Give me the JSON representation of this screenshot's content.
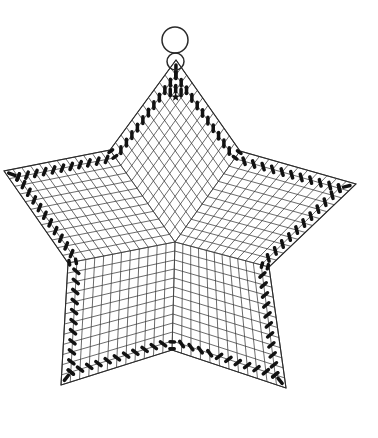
{
  "canvas": {
    "width": 378,
    "height": 438,
    "background": "#ffffff"
  },
  "style": {
    "mesh_line_color": "#3a3a3a",
    "mesh_line_width": 0.75,
    "outline_color": "#2a2a2a",
    "outline_width": 1.1,
    "bead_color": "#121212",
    "ring_color": "#2a2a2a",
    "ring_stroke_width": 1.5
  },
  "hanging_ring": {
    "large": {
      "cx": 175,
      "cy": 40,
      "r": 13
    },
    "small": {
      "cx": 175.5,
      "cy": 61.5,
      "r": 8.5
    }
  },
  "mesh": {
    "divisions": 12,
    "center": [
      175,
      242
    ],
    "kites": [
      {
        "name": "top",
        "notch_a": [
          110,
          150
        ],
        "tip": [
          176,
          60
        ],
        "notch_b": [
          240,
          151
        ]
      },
      {
        "name": "east",
        "notch_a": [
          240,
          151
        ],
        "tip": [
          356,
          184
        ],
        "notch_b": [
          269,
          267
        ]
      },
      {
        "name": "southeast",
        "notch_a": [
          269,
          267
        ],
        "tip": [
          286,
          388
        ],
        "notch_b": [
          172,
          350
        ]
      },
      {
        "name": "southwest",
        "notch_a": [
          172,
          350
        ],
        "tip": [
          61,
          385
        ],
        "notch_b": [
          68,
          263
        ]
      },
      {
        "name": "west",
        "notch_a": [
          68,
          263
        ],
        "tip": [
          4,
          171
        ],
        "notch_b": [
          110,
          150
        ]
      }
    ]
  },
  "beads": {
    "length": 6.6,
    "width": 3.5,
    "band_inset_cells": 1,
    "tip_extra_inset": 0.55,
    "notch_pair_offsets": [
      0.012,
      0.075
    ],
    "notch_bead_length": 4.4
  },
  "apex_motif": {
    "kite": "top",
    "extra_cells": [
      [
        10.1,
        10.1
      ],
      [
        9.35,
        10.35
      ],
      [
        10.35,
        9.35
      ]
    ],
    "star_marker": {
      "cell": [
        9.55,
        9.55
      ],
      "outer_r": 4.6,
      "inner_r": 1.9
    }
  }
}
